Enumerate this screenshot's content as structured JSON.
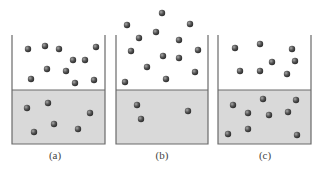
{
  "figure": {
    "panels": [
      {
        "label": "(a)",
        "box": {
          "left": 12,
          "right": 105,
          "top": 35,
          "liquid_top": 90,
          "bottom": 144
        },
        "label_x": 55,
        "vapor_particles": [
          [
            28,
            49
          ],
          [
            45,
            46
          ],
          [
            59,
            49
          ],
          [
            96,
            47
          ],
          [
            73,
            60
          ],
          [
            85,
            60
          ],
          [
            47,
            69
          ],
          [
            66,
            71
          ],
          [
            31,
            79
          ],
          [
            75,
            83
          ],
          [
            94,
            80
          ]
        ],
        "liquid_particles": [
          [
            27,
            108
          ],
          [
            48,
            103
          ],
          [
            90,
            113
          ],
          [
            54,
            124
          ],
          [
            78,
            129
          ],
          [
            34,
            132
          ]
        ]
      },
      {
        "label": "(b)",
        "box": {
          "left": 116,
          "right": 208,
          "top": 35,
          "liquid_top": 90,
          "bottom": 144
        },
        "label_x": 162,
        "vapor_particles": [
          [
            162,
            13
          ],
          [
            127,
            25
          ],
          [
            190,
            24
          ],
          [
            139,
            38
          ],
          [
            156,
            32
          ],
          [
            179,
            40
          ],
          [
            131,
            51
          ],
          [
            198,
            50
          ],
          [
            163,
            56
          ],
          [
            179,
            58
          ],
          [
            147,
            67
          ],
          [
            195,
            72
          ],
          [
            166,
            79
          ],
          [
            125,
            82
          ]
        ],
        "liquid_particles": [
          [
            137,
            105
          ],
          [
            188,
            111
          ],
          [
            141,
            119
          ]
        ]
      },
      {
        "label": "(c)",
        "box": {
          "left": 218,
          "right": 311,
          "top": 35,
          "liquid_top": 90,
          "bottom": 144
        },
        "label_x": 265,
        "vapor_particles": [
          [
            235,
            48
          ],
          [
            260,
            44
          ],
          [
            292,
            49
          ],
          [
            272,
            62
          ],
          [
            295,
            61
          ],
          [
            240,
            71
          ],
          [
            260,
            71
          ],
          [
            287,
            74
          ]
        ],
        "liquid_particles": [
          [
            263,
            99
          ],
          [
            296,
            100
          ],
          [
            233,
            105
          ],
          [
            248,
            113
          ],
          [
            269,
            115
          ],
          [
            288,
            112
          ],
          [
            248,
            129
          ],
          [
            228,
            134
          ],
          [
            297,
            135
          ]
        ]
      }
    ],
    "colors": {
      "liquid_fill": "#d9d9d9",
      "wall": "#6a6a6a",
      "particle": "#555555",
      "particle_highlight": "#9a9a9a"
    }
  }
}
